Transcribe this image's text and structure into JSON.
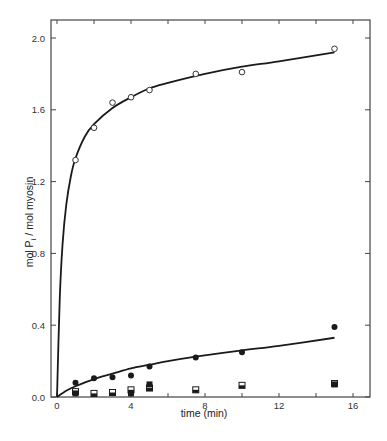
{
  "chart_data": {
    "type": "scatter",
    "title": "",
    "xlabel": "time (min)",
    "ylabel": "mol Pi / mol myosin",
    "ylabel_main": "mol P",
    "ylabel_sub": "i",
    "ylabel_rest": " / mol myosin",
    "xlim": [
      0,
      17
    ],
    "ylim": [
      0,
      2.1
    ],
    "x_ticks": [
      0,
      4,
      8,
      12,
      16
    ],
    "x_tick_labels": [
      "0",
      "4",
      "8",
      "12",
      "16"
    ],
    "y_ticks": [
      0.0,
      0.4,
      0.8,
      1.2,
      1.6,
      2.0
    ],
    "y_tick_labels": [
      "0.0",
      "0.4",
      "0.8",
      "1.2",
      "1.6",
      "2.0"
    ],
    "grid": false,
    "legend": null,
    "series": [
      {
        "name": "open circles",
        "marker": "open-circle",
        "x": [
          1,
          2,
          3,
          4,
          5,
          7.5,
          10,
          15
        ],
        "y": [
          1.32,
          1.5,
          1.64,
          1.67,
          1.71,
          1.8,
          1.81,
          1.94
        ],
        "fit_curve": true
      },
      {
        "name": "filled circles",
        "marker": "filled-circle",
        "x": [
          1,
          2,
          3,
          4,
          5,
          7.5,
          10,
          15
        ],
        "y": [
          0.08,
          0.105,
          0.11,
          0.12,
          0.17,
          0.22,
          0.25,
          0.39
        ],
        "fit_curve": true
      },
      {
        "name": "open squares",
        "marker": "open-square",
        "x": [
          1,
          2,
          3,
          4,
          5,
          7.5,
          10,
          15
        ],
        "y": [
          0.03,
          0.02,
          0.025,
          0.04,
          0.05,
          0.04,
          0.065,
          0.075
        ],
        "fit_curve": false
      },
      {
        "name": "filled squares",
        "marker": "filled-square",
        "x": [
          1,
          4,
          5,
          15
        ],
        "y": [
          0.02,
          0.02,
          0.07,
          0.07
        ],
        "fit_curve": false
      }
    ],
    "curves": [
      {
        "name": "upper-fit",
        "points": [
          [
            0,
            0
          ],
          [
            0.15,
            0.55
          ],
          [
            0.3,
            0.85
          ],
          [
            0.5,
            1.07
          ],
          [
            0.75,
            1.23
          ],
          [
            1,
            1.33
          ],
          [
            1.5,
            1.45
          ],
          [
            2,
            1.52
          ],
          [
            3,
            1.61
          ],
          [
            4,
            1.67
          ],
          [
            5,
            1.72
          ],
          [
            6,
            1.75
          ],
          [
            8,
            1.8
          ],
          [
            10,
            1.84
          ],
          [
            12,
            1.87
          ],
          [
            15,
            1.92
          ]
        ]
      },
      {
        "name": "lower-fit",
        "points": [
          [
            0,
            0
          ],
          [
            0.5,
            0.035
          ],
          [
            1,
            0.06
          ],
          [
            2,
            0.1
          ],
          [
            3,
            0.13
          ],
          [
            4,
            0.16
          ],
          [
            5,
            0.18
          ],
          [
            6,
            0.2
          ],
          [
            7.5,
            0.225
          ],
          [
            10,
            0.26
          ],
          [
            12,
            0.285
          ],
          [
            15,
            0.33
          ]
        ]
      }
    ]
  },
  "colors": {
    "ink": "#1a1a1a",
    "axis": "#444444",
    "background": "#ffffff"
  }
}
